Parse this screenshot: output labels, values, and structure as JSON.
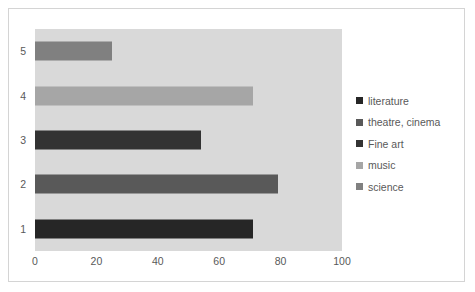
{
  "chart_data": {
    "type": "bar",
    "orientation": "horizontal",
    "title": "",
    "xlabel": "",
    "ylabel": "",
    "categories": [
      "1",
      "2",
      "3",
      "4",
      "5"
    ],
    "series": [
      {
        "name": "values",
        "values": [
          71,
          79,
          54,
          71,
          25
        ]
      }
    ],
    "bars": [
      {
        "category": "1",
        "value": 71,
        "color": "#262626",
        "legend_name": "literature"
      },
      {
        "category": "2",
        "value": 79,
        "color": "#595959",
        "legend_name": "theatre, cinema"
      },
      {
        "category": "3",
        "value": 54,
        "color": "#333333",
        "legend_name": "Fine art"
      },
      {
        "category": "4",
        "value": 71,
        "color": "#a6a6a6",
        "legend_name": "music"
      },
      {
        "category": "5",
        "value": 25,
        "color": "#808080",
        "legend_name": "science"
      }
    ],
    "xlim": [
      0,
      100
    ],
    "x_ticks": [
      "0",
      "20",
      "40",
      "60",
      "80",
      "100"
    ],
    "y_ticks_top_to_bottom": [
      "5",
      "4",
      "3",
      "2",
      "1"
    ],
    "grid": false,
    "legend_position": "right",
    "plot_background_color": "#d9d9d9",
    "legend": [
      {
        "label": "literature",
        "color": "#262626"
      },
      {
        "label": "theatre, cinema",
        "color": "#595959"
      },
      {
        "label": "Fine art",
        "color": "#333333"
      },
      {
        "label": "music",
        "color": "#a6a6a6"
      },
      {
        "label": "science",
        "color": "#808080"
      }
    ]
  }
}
